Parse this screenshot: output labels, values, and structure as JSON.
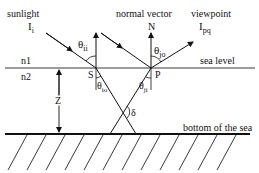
{
  "diagram": {
    "labels": {
      "sunlight": "sunlight",
      "incident_intensity": "I",
      "incident_sub": "i",
      "normal_vector": "normal vector",
      "normal_N": "N",
      "viewpoint": "viewpoint",
      "view_intensity": "I",
      "view_sub": "pq",
      "theta_ii": "θ",
      "theta_ii_sub": "ii",
      "theta_jo": "θ",
      "theta_jo_sub": "jo",
      "theta_io": "θ",
      "theta_io_sub": "io",
      "theta_ji": "θ",
      "theta_ji_sub": "ji",
      "n1": "n1",
      "n2": "n2",
      "point_S": "S",
      "point_P": "P",
      "sea_level": "sea level",
      "depth_Z": "Z",
      "delta": "δ",
      "sea_bottom": "bottom of the sea"
    }
  }
}
